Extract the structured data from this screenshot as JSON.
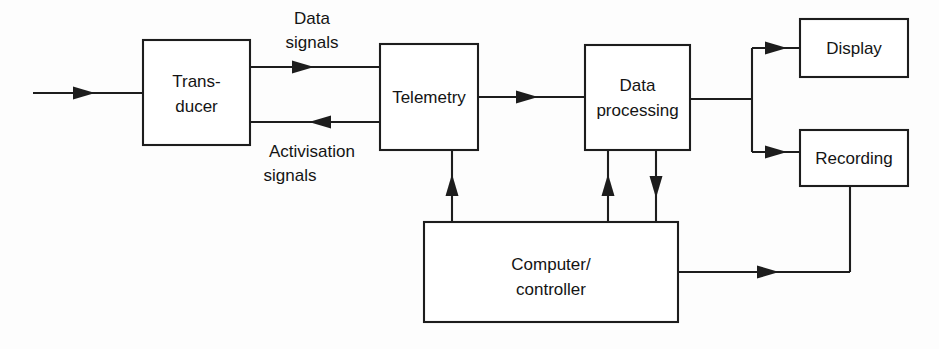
{
  "diagram": {
    "stroke_color": "#1d1d1d",
    "background_color": "#fdfdfd",
    "block_fill": "#ffffff",
    "text_color": "#141414",
    "blocks": [
      {
        "id": "transducer",
        "label_line1": "Trans-",
        "label_line2": "ducer",
        "x": 143,
        "y": 40,
        "w": 107,
        "h": 105
      },
      {
        "id": "telemetry",
        "label_line1": "Telemetry",
        "label_line2": "",
        "x": 380,
        "y": 44,
        "w": 98,
        "h": 106
      },
      {
        "id": "data-processing",
        "label_line1": "Data",
        "label_line2": "processing",
        "x": 585,
        "y": 45,
        "w": 105,
        "h": 105
      },
      {
        "id": "display",
        "label_line1": "Display",
        "label_line2": "",
        "x": 800,
        "y": 19,
        "w": 108,
        "h": 58
      },
      {
        "id": "recording",
        "label_line1": "Recording",
        "label_line2": "",
        "x": 800,
        "y": 130,
        "w": 108,
        "h": 56
      },
      {
        "id": "computer-controller",
        "label_line1": "Computer/",
        "label_line2": "controller",
        "x": 424,
        "y": 222,
        "w": 254,
        "h": 100
      }
    ],
    "edge_labels": [
      {
        "id": "data-signals",
        "line1": "Data",
        "line2": "signals",
        "cx": 312,
        "y1": 24,
        "y2": 48
      },
      {
        "id": "activisation-signals",
        "line1": "Activisation",
        "line2": "signals",
        "cx": 312,
        "y1": 157,
        "y2": 181
      }
    ],
    "connections": [
      {
        "id": "input-to-transducer",
        "from": "external-input",
        "to": "transducer",
        "arrow": "right"
      },
      {
        "id": "transducer-to-telemetry-data",
        "from": "transducer",
        "to": "telemetry",
        "arrow": "right",
        "label": "Data signals"
      },
      {
        "id": "telemetry-to-transducer-activisation",
        "from": "telemetry",
        "to": "transducer",
        "arrow": "left",
        "label": "Activisation signals"
      },
      {
        "id": "telemetry-to-data-processing",
        "from": "telemetry",
        "to": "data-processing",
        "arrow": "right"
      },
      {
        "id": "data-processing-to-display",
        "from": "data-processing",
        "to": "display",
        "arrow": "right"
      },
      {
        "id": "data-processing-to-recording",
        "from": "data-processing",
        "to": "recording",
        "arrow": "right"
      },
      {
        "id": "computer-to-telemetry",
        "from": "computer-controller",
        "to": "telemetry",
        "arrow": "up"
      },
      {
        "id": "computer-to-data-processing",
        "from": "computer-controller",
        "to": "data-processing",
        "arrow": "up"
      },
      {
        "id": "data-processing-to-computer",
        "from": "data-processing",
        "to": "computer-controller",
        "arrow": "down"
      },
      {
        "id": "computer-to-recording",
        "from": "computer-controller",
        "to": "recording",
        "arrow": "right-up"
      }
    ]
  }
}
